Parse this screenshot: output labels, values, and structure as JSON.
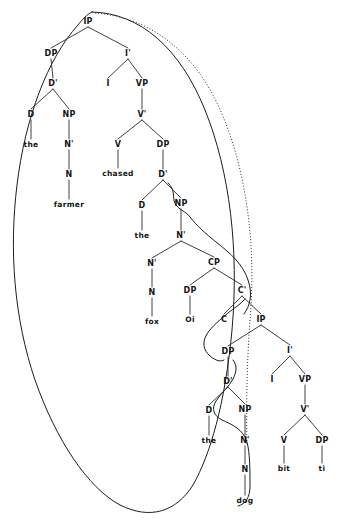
{
  "figure": {
    "kind": "syntax-tree",
    "background_color": "#ffffff",
    "line_color": "#2a2a2a",
    "text_color": "#141414"
  },
  "nodes": [
    {
      "id": "IP1",
      "label": "IP",
      "x": 88,
      "y": 24,
      "type": "nonterminal"
    },
    {
      "id": "DP1",
      "label": "DP",
      "x": 51,
      "y": 56,
      "type": "nonterminal"
    },
    {
      "id": "Ibar1",
      "label": "I'",
      "x": 128,
      "y": 56,
      "type": "nonterminal"
    },
    {
      "id": "Dbar1",
      "label": "D'",
      "x": 53,
      "y": 86,
      "type": "nonterminal"
    },
    {
      "id": "I1",
      "label": "I",
      "x": 108,
      "y": 86,
      "type": "nonterminal"
    },
    {
      "id": "VP1",
      "label": "VP",
      "x": 142,
      "y": 86,
      "type": "nonterminal"
    },
    {
      "id": "D1",
      "label": "D",
      "x": 31,
      "y": 117,
      "type": "nonterminal"
    },
    {
      "id": "NP1",
      "label": "NP",
      "x": 69,
      "y": 117,
      "type": "nonterminal"
    },
    {
      "id": "Vbar1",
      "label": "V'",
      "x": 142,
      "y": 117,
      "type": "nonterminal"
    },
    {
      "id": "the1",
      "label": "the",
      "x": 31,
      "y": 147,
      "type": "terminal"
    },
    {
      "id": "Nbar1",
      "label": "N'",
      "x": 69,
      "y": 147,
      "type": "nonterminal"
    },
    {
      "id": "V1",
      "label": "V",
      "x": 118,
      "y": 147,
      "type": "nonterminal"
    },
    {
      "id": "DP2",
      "label": "DP",
      "x": 163,
      "y": 147,
      "type": "nonterminal"
    },
    {
      "id": "N1",
      "label": "N",
      "x": 69,
      "y": 177,
      "type": "nonterminal"
    },
    {
      "id": "chased",
      "label": "chased",
      "x": 118,
      "y": 176,
      "type": "terminal"
    },
    {
      "id": "Dbar2",
      "label": "D'",
      "x": 163,
      "y": 177,
      "type": "nonterminal"
    },
    {
      "id": "farmer",
      "label": "farmer",
      "x": 69,
      "y": 207,
      "type": "terminal"
    },
    {
      "id": "D2",
      "label": "D",
      "x": 142,
      "y": 208,
      "type": "nonterminal"
    },
    {
      "id": "NP2",
      "label": "NP",
      "x": 181,
      "y": 206,
      "type": "nonterminal"
    },
    {
      "id": "the2",
      "label": "the",
      "x": 142,
      "y": 238,
      "type": "terminal"
    },
    {
      "id": "Nbar2",
      "label": "N'",
      "x": 181,
      "y": 238,
      "type": "nonterminal"
    },
    {
      "id": "Nbar3",
      "label": "N'",
      "x": 152,
      "y": 266,
      "type": "nonterminal"
    },
    {
      "id": "CP1",
      "label": "CP",
      "x": 214,
      "y": 265,
      "type": "nonterminal"
    },
    {
      "id": "N2",
      "label": "N",
      "x": 152,
      "y": 295,
      "type": "nonterminal"
    },
    {
      "id": "DP3",
      "label": "DP",
      "x": 190,
      "y": 293,
      "type": "nonterminal"
    },
    {
      "id": "Cbar1",
      "label": "C'",
      "x": 242,
      "y": 293,
      "type": "nonterminal"
    },
    {
      "id": "fox",
      "label": "fox",
      "x": 152,
      "y": 324,
      "type": "terminal"
    },
    {
      "id": "Oi",
      "label": "Oi",
      "x": 190,
      "y": 322,
      "type": "terminal"
    },
    {
      "id": "C1",
      "label": "C",
      "x": 224,
      "y": 322,
      "type": "nonterminal"
    },
    {
      "id": "IP2",
      "label": "IP",
      "x": 261,
      "y": 322,
      "type": "nonterminal"
    },
    {
      "id": "DP4",
      "label": "DP",
      "x": 228,
      "y": 354,
      "type": "nonterminal"
    },
    {
      "id": "Ibar2",
      "label": "I'",
      "x": 290,
      "y": 353,
      "type": "nonterminal"
    },
    {
      "id": "Dbar3",
      "label": "D'",
      "x": 228,
      "y": 384,
      "type": "nonterminal"
    },
    {
      "id": "I2",
      "label": "I",
      "x": 272,
      "y": 382,
      "type": "nonterminal"
    },
    {
      "id": "VP2",
      "label": "VP",
      "x": 305,
      "y": 382,
      "type": "nonterminal"
    },
    {
      "id": "D3",
      "label": "D",
      "x": 209,
      "y": 413,
      "type": "nonterminal"
    },
    {
      "id": "NP3",
      "label": "NP",
      "x": 245,
      "y": 412,
      "type": "nonterminal"
    },
    {
      "id": "Vbar2",
      "label": "V'",
      "x": 305,
      "y": 412,
      "type": "nonterminal"
    },
    {
      "id": "the3",
      "label": "the",
      "x": 209,
      "y": 443,
      "type": "terminal"
    },
    {
      "id": "Nbar4",
      "label": "N'",
      "x": 245,
      "y": 443,
      "type": "nonterminal"
    },
    {
      "id": "V2",
      "label": "V",
      "x": 284,
      "y": 443,
      "type": "nonterminal"
    },
    {
      "id": "DP5",
      "label": "DP",
      "x": 322,
      "y": 443,
      "type": "nonterminal"
    },
    {
      "id": "N3",
      "label": "N",
      "x": 245,
      "y": 472,
      "type": "nonterminal"
    },
    {
      "id": "bit",
      "label": "bit",
      "x": 284,
      "y": 471,
      "type": "terminal"
    },
    {
      "id": "ti",
      "label": "ti",
      "x": 322,
      "y": 471,
      "type": "terminal"
    },
    {
      "id": "dog",
      "label": "dog",
      "x": 245,
      "y": 503,
      "type": "terminal"
    }
  ],
  "edges": [
    {
      "from": "IP1",
      "to": "DP1"
    },
    {
      "from": "IP1",
      "to": "Ibar1"
    },
    {
      "from": "DP1",
      "to": "Dbar1"
    },
    {
      "from": "Ibar1",
      "to": "I1"
    },
    {
      "from": "Ibar1",
      "to": "VP1"
    },
    {
      "from": "Dbar1",
      "to": "D1"
    },
    {
      "from": "Dbar1",
      "to": "NP1"
    },
    {
      "from": "VP1",
      "to": "Vbar1"
    },
    {
      "from": "D1",
      "to": "the1"
    },
    {
      "from": "NP1",
      "to": "Nbar1"
    },
    {
      "from": "Vbar1",
      "to": "V1"
    },
    {
      "from": "Vbar1",
      "to": "DP2"
    },
    {
      "from": "Nbar1",
      "to": "N1"
    },
    {
      "from": "V1",
      "to": "chased"
    },
    {
      "from": "DP2",
      "to": "Dbar2"
    },
    {
      "from": "N1",
      "to": "farmer"
    },
    {
      "from": "Dbar2",
      "to": "D2"
    },
    {
      "from": "Dbar2",
      "to": "NP2"
    },
    {
      "from": "D2",
      "to": "the2"
    },
    {
      "from": "NP2",
      "to": "Nbar2"
    },
    {
      "from": "Nbar2",
      "to": "Nbar3"
    },
    {
      "from": "Nbar2",
      "to": "CP1"
    },
    {
      "from": "Nbar3",
      "to": "N2"
    },
    {
      "from": "CP1",
      "to": "DP3"
    },
    {
      "from": "CP1",
      "to": "Cbar1"
    },
    {
      "from": "N2",
      "to": "fox"
    },
    {
      "from": "DP3",
      "to": "Oi"
    },
    {
      "from": "Cbar1",
      "to": "C1"
    },
    {
      "from": "Cbar1",
      "to": "IP2"
    },
    {
      "from": "IP2",
      "to": "DP4"
    },
    {
      "from": "IP2",
      "to": "Ibar2"
    },
    {
      "from": "DP4",
      "to": "Dbar3"
    },
    {
      "from": "Ibar2",
      "to": "I2"
    },
    {
      "from": "Ibar2",
      "to": "VP2"
    },
    {
      "from": "Dbar3",
      "to": "D3"
    },
    {
      "from": "Dbar3",
      "to": "NP3"
    },
    {
      "from": "VP2",
      "to": "Vbar2"
    },
    {
      "from": "D3",
      "to": "the3"
    },
    {
      "from": "NP3",
      "to": "Nbar4"
    },
    {
      "from": "Vbar2",
      "to": "V2"
    },
    {
      "from": "Vbar2",
      "to": "DP5"
    },
    {
      "from": "Nbar4",
      "to": "N3"
    },
    {
      "from": "V2",
      "to": "bit"
    },
    {
      "from": "DP5",
      "to": "ti"
    },
    {
      "from": "N3",
      "to": "dog"
    }
  ],
  "arcs": [
    {
      "id": "arc-outer-solid",
      "style": "solid",
      "description": "large outer oval enclosing the whole matrix clause"
    },
    {
      "id": "arc-outer-dotted",
      "style": "dotted",
      "description": "dotted oval parallel to the solid outer oval"
    },
    {
      "id": "arc-np1",
      "style": "solid",
      "description": "curve from NP node through N' down to lower structure"
    },
    {
      "id": "arc-cbar",
      "style": "solid",
      "description": "curve from C' down toward the embedded DP"
    },
    {
      "id": "arc-np3",
      "style": "solid",
      "description": "curve from lower NP through N' to the bottom"
    }
  ]
}
